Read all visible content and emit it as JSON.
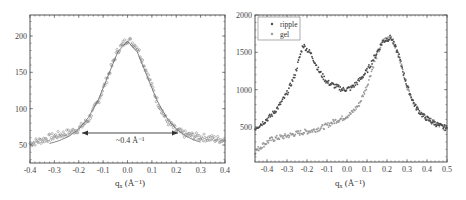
{
  "chart_data": [
    {
      "type": "scatter",
      "title": "",
      "xlabel": "q_x (Å⁻¹)",
      "ylabel": "",
      "xlim": [
        -0.4,
        0.4
      ],
      "ylim": [
        25,
        230
      ],
      "x_ticks": [
        "-0.4",
        "-0.3",
        "-0.2",
        "-0.1",
        "0.0",
        "0.1",
        "0.2",
        "0.3",
        "0.4"
      ],
      "y_ticks": [
        "50",
        "100",
        "150",
        "200"
      ],
      "grid": false,
      "series": [
        {
          "name": "data",
          "style": "open-circles",
          "x": [
            -0.4,
            -0.36,
            -0.32,
            -0.28,
            -0.24,
            -0.2,
            -0.16,
            -0.12,
            -0.08,
            -0.04,
            0.0,
            0.04,
            0.08,
            0.12,
            0.16,
            0.2,
            0.24,
            0.28,
            0.32,
            0.36,
            0.4
          ],
          "y": [
            52,
            56,
            60,
            64,
            67,
            72,
            85,
            110,
            145,
            180,
            196,
            185,
            150,
            112,
            84,
            70,
            64,
            62,
            60,
            58,
            57
          ]
        },
        {
          "name": "gaussian-fit",
          "style": "line",
          "x": [
            -0.32,
            -0.28,
            -0.24,
            -0.2,
            -0.16,
            -0.12,
            -0.08,
            -0.04,
            0.0,
            0.04,
            0.08,
            0.12,
            0.16,
            0.2,
            0.24,
            0.28,
            0.3
          ],
          "y": [
            52,
            56,
            62,
            72,
            88,
            112,
            145,
            178,
            193,
            178,
            145,
            112,
            88,
            72,
            62,
            56,
            54
          ]
        }
      ],
      "annotations": [
        {
          "text": "~0.4 Å⁻¹",
          "type": "double-arrow",
          "x_from": -0.2,
          "x_to": 0.2,
          "y": 67
        }
      ]
    },
    {
      "type": "scatter",
      "title": "",
      "xlabel": "q_x (Å⁻¹)",
      "ylabel": "",
      "xlim": [
        -0.46,
        0.5
      ],
      "ylim": [
        45,
        2000
      ],
      "x_ticks": [
        "-0.4",
        "-0.3",
        "-0.2",
        "-0.1",
        "0.0",
        "0.1",
        "0.2",
        "0.3",
        "0.4",
        "0.5"
      ],
      "y_ticks": [
        "500",
        "1000",
        "1500",
        "2000"
      ],
      "grid": false,
      "legend": {
        "position": "upper-left",
        "entries": [
          "ripple",
          "gel"
        ]
      },
      "series": [
        {
          "name": "ripple",
          "x": [
            -0.46,
            -0.42,
            -0.38,
            -0.34,
            -0.3,
            -0.26,
            -0.22,
            -0.18,
            -0.14,
            -0.1,
            -0.06,
            -0.02,
            0.02,
            0.06,
            0.1,
            0.14,
            0.18,
            0.22,
            0.26,
            0.3,
            0.34,
            0.38,
            0.42,
            0.46,
            0.5
          ],
          "y": [
            480,
            560,
            650,
            780,
            950,
            1200,
            1600,
            1480,
            1250,
            1100,
            1050,
            1000,
            1020,
            1120,
            1250,
            1450,
            1650,
            1700,
            1450,
            1050,
            780,
            650,
            580,
            520,
            480
          ]
        },
        {
          "name": "gel",
          "x": [
            -0.46,
            -0.42,
            -0.38,
            -0.34,
            -0.3,
            -0.26,
            -0.22,
            -0.18,
            -0.14,
            -0.1,
            -0.06,
            -0.02,
            0.02,
            0.06,
            0.1,
            0.14,
            0.18,
            0.22,
            0.26,
            0.3,
            0.34,
            0.38,
            0.42,
            0.46,
            0.5
          ],
          "y": [
            170,
            260,
            330,
            360,
            380,
            410,
            430,
            450,
            480,
            520,
            580,
            620,
            680,
            800,
            1050,
            1400,
            1650,
            1720,
            1450,
            1050,
            780,
            650,
            580,
            520,
            480
          ]
        }
      ]
    }
  ],
  "left_plot": {
    "x_ticks": [
      "-0.4",
      "-0.3",
      "-0.2",
      "-0.1",
      "0.0",
      "0.1",
      "0.2",
      "0.3",
      "0.4"
    ],
    "y_ticks": [
      "50",
      "100",
      "150",
      "200"
    ],
    "xlabel_main": "q",
    "xlabel_sub": "x",
    "xlabel_unit": " (Å⁻¹)",
    "annotation": "~0.4 Å⁻¹"
  },
  "right_plot": {
    "x_ticks": [
      "-0.4",
      "-0.3",
      "-0.2",
      "-0.1",
      "0.0",
      "0.1",
      "0.2",
      "0.3",
      "0.4",
      "0.5"
    ],
    "y_ticks": [
      "500",
      "1000",
      "1500",
      "2000"
    ],
    "xlabel_main": "q",
    "xlabel_sub": "x",
    "xlabel_unit": " (Å⁻¹)",
    "legend": [
      {
        "label": "ripple",
        "color": "#4a4a4a"
      },
      {
        "label": "gel",
        "color": "#9a9a9a"
      }
    ]
  },
  "colors": {
    "ripple": "#4a4a4a",
    "gel": "#9a9a9a",
    "left_data": "#7a7a7a",
    "fit_line": "#666666",
    "frame": "#555555"
  }
}
